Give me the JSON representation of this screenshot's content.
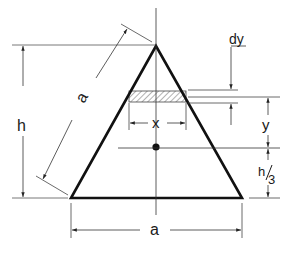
{
  "figure": {
    "labels": {
      "side": "a",
      "height": "h",
      "base": "a",
      "strip_width": "x",
      "strip_thickness": "dy",
      "strip_height": "y",
      "centroid_height_num": "h",
      "centroid_height_den": "3"
    },
    "colors": {
      "outline": "#111111",
      "dimension": "#333333",
      "hatch": "#555555",
      "background": "#ffffff"
    }
  }
}
